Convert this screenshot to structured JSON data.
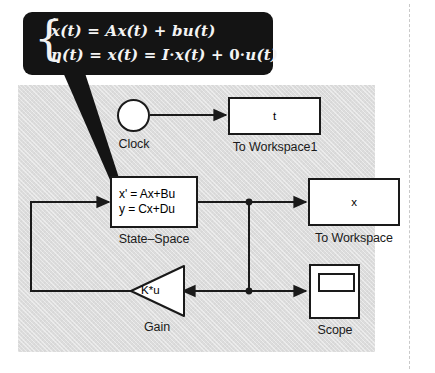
{
  "diagram": {
    "canvas_color": "#dcdcdc",
    "line_color": "#1a1a1a",
    "block_fill": "#ffffff"
  },
  "callout": {
    "background": "#141414",
    "text_color": "#f4f4f4",
    "equation_1_plain": "ẋ(t) = Ax(t) + bu(t)",
    "equation_2_plain": "η(t) = x(t) = I·x(t) + 0·u(t)",
    "eq1": {
      "lhs_var": "x",
      "eq": "=",
      "term_a": "A",
      "term_x": "x(t)",
      "plus": "+",
      "term_b": "b",
      "term_u": "u(t)",
      "open_paren": "(t)"
    },
    "eq2": {
      "eta": "η(t)",
      "eq1": "=",
      "x_t": "x(t)",
      "eq2": "=",
      "I": "I",
      "dot1": "·",
      "x_t2": "x(t)",
      "plus": "+",
      "zero": "0",
      "dot2": "·",
      "u_t": "u(t)"
    },
    "brace": "{"
  },
  "blocks": {
    "clock": {
      "icon": "clock-icon",
      "caption": "Clock"
    },
    "to_workspace1": {
      "value": "t",
      "caption": "To Workspace1"
    },
    "state_space": {
      "line1": "x' = Ax+Bu",
      "line2": "y = Cx+Du",
      "caption": "State–Space"
    },
    "to_workspace": {
      "value": "x",
      "caption": "To Workspace"
    },
    "gain": {
      "value": "K*u",
      "caption": "Gain"
    },
    "scope": {
      "icon": "scope-icon",
      "caption": "Scope"
    }
  }
}
